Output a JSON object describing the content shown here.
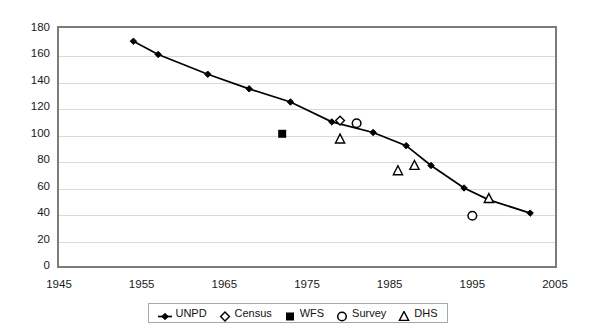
{
  "chart_data": {
    "type": "line",
    "title": "",
    "subtitle": "",
    "xlabel": "",
    "ylabel": "",
    "xlim": [
      1945,
      2005
    ],
    "ylim": [
      0,
      180
    ],
    "xticks": [
      1945,
      1955,
      1965,
      1975,
      1985,
      1995,
      2005
    ],
    "yticks": [
      0,
      20,
      40,
      60,
      80,
      100,
      120,
      140,
      160,
      180
    ],
    "grid": "horizontal",
    "legend_position": "bottom-center",
    "series": [
      {
        "name": "UNPD",
        "marker": "filled-diamond",
        "line": true,
        "color": "#000000",
        "points": [
          {
            "x": 1954,
            "y": 170
          },
          {
            "x": 1957,
            "y": 160
          },
          {
            "x": 1963,
            "y": 145
          },
          {
            "x": 1968,
            "y": 134
          },
          {
            "x": 1973,
            "y": 124
          },
          {
            "x": 1978,
            "y": 109
          },
          {
            "x": 1983,
            "y": 101
          },
          {
            "x": 1987,
            "y": 91
          },
          {
            "x": 1990,
            "y": 76
          },
          {
            "x": 1994,
            "y": 59
          },
          {
            "x": 1997,
            "y": 50
          },
          {
            "x": 2002,
            "y": 40
          }
        ]
      },
      {
        "name": "Census",
        "marker": "open-diamond",
        "line": false,
        "color": "#000000",
        "points": [
          {
            "x": 1979,
            "y": 110
          }
        ]
      },
      {
        "name": "WFS",
        "marker": "filled-square",
        "line": false,
        "color": "#000000",
        "points": [
          {
            "x": 1972,
            "y": 100
          }
        ]
      },
      {
        "name": "Survey",
        "marker": "open-circle",
        "line": false,
        "color": "#000000",
        "points": [
          {
            "x": 1981,
            "y": 108
          },
          {
            "x": 1995,
            "y": 38
          }
        ]
      },
      {
        "name": "DHS",
        "marker": "open-triangle",
        "line": false,
        "color": "#000000",
        "points": [
          {
            "x": 1979,
            "y": 96
          },
          {
            "x": 1986,
            "y": 72
          },
          {
            "x": 1988,
            "y": 76
          },
          {
            "x": 1997,
            "y": 51
          }
        ]
      }
    ]
  },
  "legend": {
    "items": [
      {
        "label": "UNPD",
        "marker": "filled-diamond"
      },
      {
        "label": "Census",
        "marker": "open-diamond"
      },
      {
        "label": "WFS",
        "marker": "filled-square"
      },
      {
        "label": "Survey",
        "marker": "open-circle"
      },
      {
        "label": "DHS",
        "marker": "open-triangle"
      }
    ]
  },
  "colors": {
    "series": "#000000",
    "gridline": "#d9d9d9",
    "frame": "#7b7b7b",
    "background": "#ffffff"
  }
}
